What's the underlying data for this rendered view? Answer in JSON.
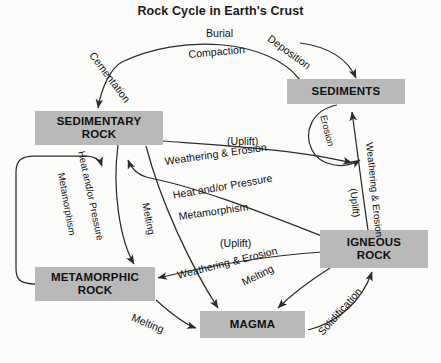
{
  "title": "Rock Cycle in Earth's Crust",
  "theme": {
    "box_fill": "#b9b9b9",
    "stroke": "#2b2b2b",
    "text": "#111111",
    "background": "#fcfcfb"
  },
  "nodes": [
    {
      "id": "sedimentary",
      "label": "SEDIMENTARY\nROCK",
      "line1": "SEDIMENTARY",
      "line2": "ROCK"
    },
    {
      "id": "sediments",
      "label": "SEDIMENTS",
      "line1": "SEDIMENTS",
      "line2": ""
    },
    {
      "id": "igneous",
      "label": "IGNEOUS\nROCK",
      "line1": "IGNEOUS",
      "line2": "ROCK"
    },
    {
      "id": "metamorphic",
      "label": "METAMORPHIC\nROCK",
      "line1": "METAMORPHIC",
      "line2": "ROCK"
    },
    {
      "id": "magma",
      "label": "MAGMA",
      "line1": "MAGMA",
      "line2": ""
    }
  ],
  "edge_labels": {
    "burial": "Burial",
    "compaction": "Compaction",
    "cementation": "Cementation",
    "deposition": "Deposition",
    "erosion_loop": "Erosion",
    "uplift_upper": "(Uplift)",
    "weathering_erosion_upper": "Weathering & Erosion",
    "heat_pressure_center": "Heat and/or Pressure",
    "metamorphism_center": "Metamorphism",
    "heat_pressure_left": "Heat and/or Pressure",
    "metamorphism_left": "Metamorphism",
    "melting_left": "Melting",
    "uplift_lower": "(Uplift)",
    "weathering_erosion_lower": "Weathering & Erosion",
    "weathering_erosion_right": "Weathering & Erosion",
    "uplift_right": "(Uplift)",
    "melting_center": "Melting",
    "melting_bottom": "Melting",
    "solidification": "Solidification"
  },
  "processes": [
    {
      "from": "sediments",
      "to": "sedimentary",
      "labels": [
        "Burial",
        "Compaction",
        "Cementation"
      ]
    },
    {
      "from": "sedimentary",
      "to": "sediments",
      "labels": [
        "Weathering & Erosion",
        "(Uplift)"
      ]
    },
    {
      "from": "sedimentary",
      "to": "metamorphic",
      "labels": [
        "Heat and/or Pressure",
        "Metamorphism"
      ]
    },
    {
      "from": "metamorphic",
      "to": "sedimentary",
      "labels": [
        "Metamorphism"
      ]
    },
    {
      "from": "sedimentary",
      "to": "magma",
      "labels": [
        "Melting"
      ]
    },
    {
      "from": "igneous",
      "to": "sedimentary",
      "labels": [
        "Heat and/or Pressure",
        "Metamorphism"
      ]
    },
    {
      "from": "igneous",
      "to": "metamorphic",
      "labels": [
        "Weathering & Erosion",
        "(Uplift)"
      ]
    },
    {
      "from": "igneous",
      "to": "sediments",
      "labels": [
        "Weathering & Erosion",
        "(Uplift)"
      ]
    },
    {
      "from": "igneous",
      "to": "magma",
      "labels": [
        "Melting"
      ]
    },
    {
      "from": "magma",
      "to": "igneous",
      "labels": [
        "Solidification"
      ]
    },
    {
      "from": "metamorphic",
      "to": "magma",
      "labels": [
        "Melting"
      ]
    },
    {
      "from": "sediments",
      "to": "sediments",
      "labels": [
        "Erosion"
      ]
    }
  ]
}
